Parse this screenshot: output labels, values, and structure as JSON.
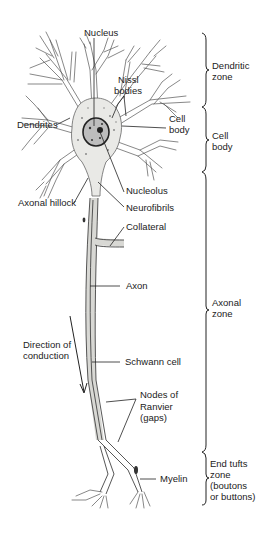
{
  "figure": {
    "type": "labeled anatomical diagram",
    "structure_labels": [
      {
        "id": "nucleus",
        "text": "Nucleus"
      },
      {
        "id": "nissl_1",
        "text": "Nissl"
      },
      {
        "id": "nissl_2",
        "text": "bodies"
      },
      {
        "id": "cell_body_1",
        "text": "Cell"
      },
      {
        "id": "cell_body_2",
        "text": "body"
      },
      {
        "id": "dendrites",
        "text": "Dendrites"
      },
      {
        "id": "nucleolus",
        "text": "Nucleolus"
      },
      {
        "id": "axonal_hillock",
        "text": "Axonal hillock"
      },
      {
        "id": "neurofibrils",
        "text": "Neurofibrils"
      },
      {
        "id": "collateral",
        "text": "Collateral"
      },
      {
        "id": "axon",
        "text": "Axon"
      },
      {
        "id": "direction_1",
        "text": "Direction of"
      },
      {
        "id": "direction_2",
        "text": "conduction"
      },
      {
        "id": "schwann",
        "text": "Schwann cell"
      },
      {
        "id": "nodes_1",
        "text": "Nodes of"
      },
      {
        "id": "nodes_2",
        "text": "Ranvier"
      },
      {
        "id": "nodes_3",
        "text": "(gaps)"
      },
      {
        "id": "myelin",
        "text": "Myelin"
      }
    ],
    "zones": [
      {
        "id": "dendritic",
        "lines": [
          "Dendritic",
          "zone"
        ],
        "y_start": 33,
        "y_end": 107
      },
      {
        "id": "cell_body",
        "lines": [
          "Cell",
          "body"
        ],
        "y_start": 107,
        "y_end": 172
      },
      {
        "id": "axonal",
        "lines": [
          "Axonal",
          "zone"
        ],
        "y_start": 172,
        "y_end": 452
      },
      {
        "id": "end_tufts",
        "lines": [
          "End tufts",
          "zone",
          "(boutons",
          "or buttons)"
        ],
        "y_start": 452,
        "y_end": 505
      }
    ]
  },
  "labels": {
    "nucleus": "Nucleus",
    "nissl_1": "Nissl",
    "nissl_2": "bodies",
    "cell_body_1": "Cell",
    "cell_body_2": "body",
    "dendrites": "Dendrites",
    "nucleolus": "Nucleolus",
    "axonal_hillock": "Axonal hillock",
    "neurofibrils": "Neurofibrils",
    "collateral": "Collateral",
    "axon": "Axon",
    "direction_1": "Direction of",
    "direction_2": "conduction",
    "schwann": "Schwann cell",
    "nodes_1": "Nodes of",
    "nodes_2": "Ranvier",
    "nodes_3": "(gaps)",
    "myelin": "Myelin"
  },
  "zones": {
    "dendritic_1": "Dendritic",
    "dendritic_2": "zone",
    "cellbody_1": "Cell",
    "cellbody_2": "body",
    "axonal_1": "Axonal",
    "axonal_2": "zone",
    "endtufts_1": "End tufts",
    "endtufts_2": "zone",
    "endtufts_3": "(boutons",
    "endtufts_4": "or buttons)"
  },
  "colors": {
    "ink": "#222222",
    "background": "#ffffff",
    "cytoplasm": "#e9e9e6"
  }
}
